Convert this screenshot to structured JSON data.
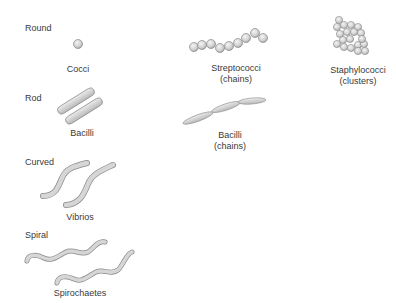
{
  "categories": [
    {
      "label": "Round"
    },
    {
      "label": "Rod"
    },
    {
      "label": "Curved"
    },
    {
      "label": "Spiral"
    }
  ],
  "bacteria": {
    "cocci": {
      "name": "Cocci",
      "note": ""
    },
    "streptococci": {
      "name": "Streptococci",
      "note": "(chains)"
    },
    "staphylococci": {
      "name": "Staphylococci",
      "note": "(clusters)"
    },
    "bacilli": {
      "name": "Bacilli",
      "note": ""
    },
    "bacilli_chains": {
      "name": "Bacilli",
      "note": "(chains)"
    },
    "vibrios": {
      "name": "Vibrios",
      "note": ""
    },
    "spirochaetes": {
      "name": "Spirochaetes",
      "note": ""
    }
  },
  "colors": {
    "cell_fill": "#d6d6d6",
    "cell_stroke": "#8a8a8a",
    "text": "#3a3a3a"
  }
}
